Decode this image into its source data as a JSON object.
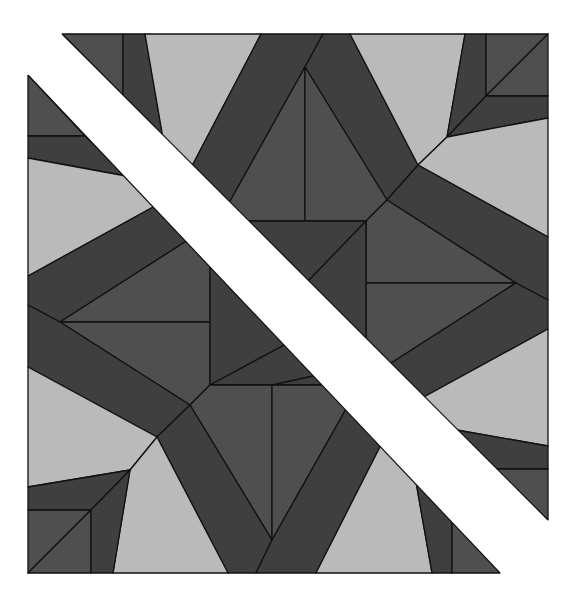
{
  "figure": {
    "type": "geometric-quilt-block",
    "canvas": {
      "width": 578,
      "height": 602
    },
    "block_bounds": {
      "left": 28,
      "top": 34,
      "right": 548,
      "bottom": 573
    },
    "colors": {
      "background": "#ffffff",
      "light": "#bababa",
      "medium": "#4f4f4f",
      "dark": "#3f3f3f",
      "outline": "#111111",
      "diagonal_band": "#ffffff"
    },
    "diagonal_band": {
      "upper_edge": [
        [
          62,
          34
        ],
        [
          548,
          520
        ]
      ],
      "lower_edge": [
        [
          28,
          75
        ],
        [
          500,
          573
        ]
      ]
    }
  }
}
